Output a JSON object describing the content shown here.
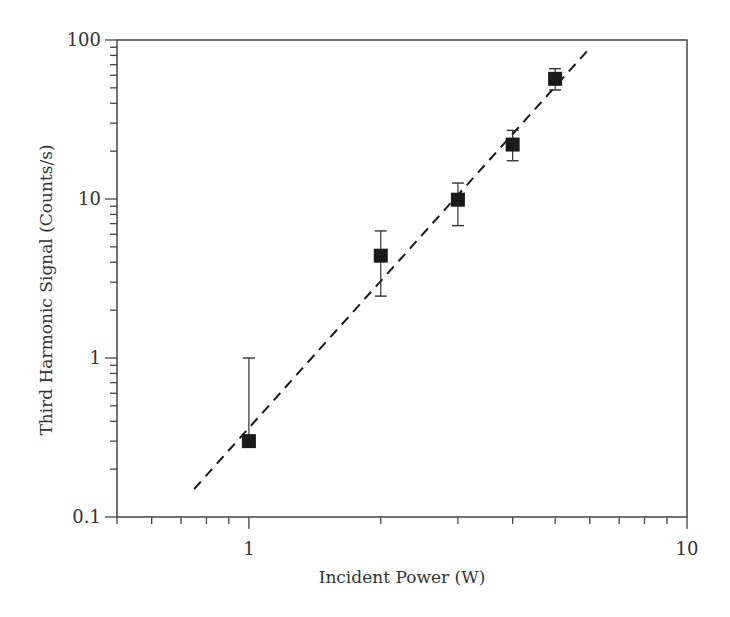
{
  "chart_data": {
    "type": "scatter",
    "title": "",
    "xlabel": "Incident Power (W)",
    "ylabel": "Third Harmonic Signal (Counts/s)",
    "xscale": "log",
    "yscale": "log",
    "xlim": [
      0.5,
      10
    ],
    "ylim": [
      0.1,
      100
    ],
    "grid": false,
    "legend": null,
    "x_ticks": [
      {
        "value": 1,
        "label": "1"
      },
      {
        "value": 10,
        "label": "10"
      }
    ],
    "y_ticks": [
      {
        "value": 0.1,
        "label": "0.1"
      },
      {
        "value": 1,
        "label": "1"
      },
      {
        "value": 10,
        "label": "10"
      },
      {
        "value": 100,
        "label": "100"
      }
    ],
    "series": [
      {
        "name": "Measured data",
        "marker": "filled-square",
        "color": "#1a1a1a",
        "points": [
          {
            "x": 1,
            "y": 0.3,
            "y_err_low": null,
            "y_err_high": 1.0
          },
          {
            "x": 2,
            "y": 4.4,
            "y_err_low": 2.45,
            "y_err_high": 6.3
          },
          {
            "x": 3,
            "y": 9.9,
            "y_err_low": 6.8,
            "y_err_high": 12.6
          },
          {
            "x": 4,
            "y": 22,
            "y_err_low": 17.4,
            "y_err_high": 27
          },
          {
            "x": 5,
            "y": 57,
            "y_err_low": 48.5,
            "y_err_high": 66
          }
        ]
      },
      {
        "name": "Cubic fit",
        "style": "dashed-line",
        "color": "#1a1a1a",
        "slope": 3,
        "points": [
          {
            "x": 0.75,
            "y": 0.15
          },
          {
            "x": 6.0,
            "y": 89
          }
        ]
      }
    ]
  },
  "colors": {
    "axis": "#444444",
    "text": "#333333",
    "marker": "#1a1a1a"
  }
}
